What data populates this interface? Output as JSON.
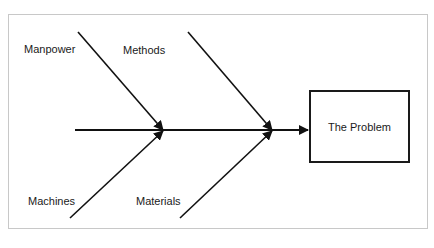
{
  "diagram": {
    "type": "fishbone",
    "problem": "The Problem",
    "categories": [
      {
        "label": "Manpower",
        "position": "top-left"
      },
      {
        "label": "Methods",
        "position": "top-right"
      },
      {
        "label": "Machines",
        "position": "bottom-left"
      },
      {
        "label": "Materials",
        "position": "bottom-right"
      }
    ],
    "colors": {
      "line": "#111111",
      "frame": "#c8c8c8",
      "background": "#ffffff"
    }
  }
}
